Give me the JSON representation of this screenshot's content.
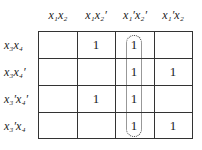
{
  "kmap": {
    "columns": [
      {
        "label": "x1x2",
        "display": "x₁x₂"
      },
      {
        "label": "x1x2'",
        "display": "x₁x₂′"
      },
      {
        "label": "x1'x2'",
        "display": "x₁′x₂′"
      },
      {
        "label": "x1'x2",
        "display": "x₁′x₂"
      }
    ],
    "rows": [
      {
        "label": "x3x4",
        "display": "x₃x₄"
      },
      {
        "label": "x3x4'",
        "display": "x₃x₄′"
      },
      {
        "label": "x3'x4'",
        "display": "x₃′x₄′"
      },
      {
        "label": "x3'x4",
        "display": "x₃′x₄"
      }
    ],
    "cells": [
      [
        "",
        "1",
        "1",
        ""
      ],
      [
        "",
        "",
        "1",
        "1"
      ],
      [
        "",
        "1",
        "1",
        ""
      ],
      [
        "",
        "",
        "1",
        "1"
      ]
    ],
    "groupings": [
      {
        "style": "dotted",
        "column": 2,
        "rows": [
          0,
          1,
          2,
          3
        ],
        "term": "x1'x2'"
      }
    ]
  }
}
